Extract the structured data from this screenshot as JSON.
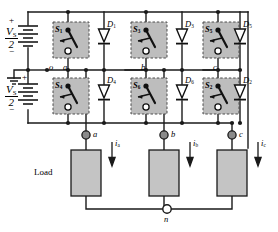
{
  "figure": {
    "colors": {
      "wire": "#1a1a1a",
      "device_fill": "#bdbdbd",
      "device_border": "#4d4d4d",
      "node_filled": "#808080",
      "node_open": "#ffffff",
      "text": "#000000"
    }
  },
  "source": {
    "upper": {
      "plus": "+",
      "minus": "−",
      "numerator": "V",
      "subscript": "S",
      "denominator": "2"
    },
    "lower": {
      "plus": "+",
      "minus": "−",
      "numerator": "V",
      "subscript": "S",
      "denominator": "2"
    },
    "ground_label": "",
    "midpoint_node": "o"
  },
  "switches": [
    {
      "id": "S1",
      "label": "S",
      "sub": "1",
      "leg": "a",
      "position": "upper"
    },
    {
      "id": "S3",
      "label": "S",
      "sub": "3",
      "leg": "b",
      "position": "upper"
    },
    {
      "id": "S5",
      "label": "S",
      "sub": "5",
      "leg": "c",
      "position": "upper"
    },
    {
      "id": "S4",
      "label": "S",
      "sub": "4",
      "leg": "a",
      "position": "lower"
    },
    {
      "id": "S6",
      "label": "S",
      "sub": "6",
      "leg": "b",
      "position": "lower"
    },
    {
      "id": "S2",
      "label": "S",
      "sub": "2",
      "leg": "c",
      "position": "lower"
    }
  ],
  "diodes": [
    {
      "id": "D1",
      "label": "D",
      "sub": "1",
      "leg": "a",
      "position": "upper"
    },
    {
      "id": "D3",
      "label": "D",
      "sub": "3",
      "leg": "b",
      "position": "upper"
    },
    {
      "id": "D5",
      "label": "D",
      "sub": "5",
      "leg": "c",
      "position": "upper"
    },
    {
      "id": "D4",
      "label": "D",
      "sub": "4",
      "leg": "a",
      "position": "lower"
    },
    {
      "id": "D6",
      "label": "D",
      "sub": "6",
      "leg": "b",
      "position": "lower"
    },
    {
      "id": "D2",
      "label": "D",
      "sub": "2",
      "leg": "c",
      "position": "lower"
    }
  ],
  "phase_nodes": [
    {
      "id": "a",
      "label": "a"
    },
    {
      "id": "b",
      "label": "b"
    },
    {
      "id": "c",
      "label": "c"
    }
  ],
  "output_nodes": [
    {
      "id": "a",
      "label": "a"
    },
    {
      "id": "b",
      "label": "b"
    },
    {
      "id": "c",
      "label": "c"
    }
  ],
  "currents": [
    {
      "id": "ia",
      "label": "i",
      "sub": "a"
    },
    {
      "id": "ib",
      "label": "i",
      "sub": "b"
    },
    {
      "id": "ic",
      "label": "i",
      "sub": "c"
    }
  ],
  "load": {
    "label": "Load",
    "neutral_node": "n"
  }
}
